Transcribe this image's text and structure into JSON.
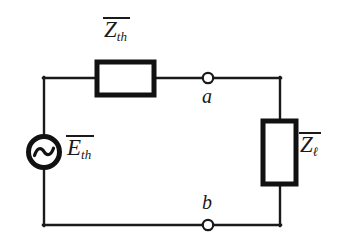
{
  "diagram": {
    "type": "circuit-schematic",
    "background_color": "#ffffff",
    "line_color": "#1a1a1a",
    "components": {
      "source": {
        "name": "ac-voltage-source",
        "symbol": "circle-with-sine-wave",
        "label_symbol": "E",
        "label_subscript": "th",
        "label_overbar": true,
        "label_text": "E̅th"
      },
      "series_impedance": {
        "name": "thevenin-impedance",
        "symbol": "rectangle-horizontal",
        "label_symbol": "Z",
        "label_subscript": "th",
        "label_overbar": true,
        "label_text": "Z̅th"
      },
      "load_impedance": {
        "name": "load-impedance",
        "symbol": "rectangle-vertical",
        "label_symbol": "Z",
        "label_subscript": "ℓ",
        "label_overbar": true,
        "label_text": "Z̅ℓ"
      },
      "terminal_a": {
        "name": "terminal-node-a",
        "label": "a",
        "symbol": "open-circle"
      },
      "terminal_b": {
        "name": "terminal-node-b",
        "label": "b",
        "symbol": "open-circle"
      }
    }
  }
}
